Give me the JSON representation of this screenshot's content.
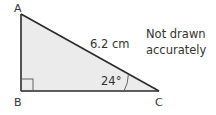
{
  "diagram": {
    "type": "right-triangle",
    "vertices": {
      "A": {
        "label": "A",
        "x": 21,
        "y": 14
      },
      "B": {
        "label": "B",
        "x": 21,
        "y": 91
      },
      "C": {
        "label": "C",
        "x": 159,
        "y": 91
      }
    },
    "hypotenuse_label": "6.2 cm",
    "angle_label": "24°",
    "right_angle_at": "B",
    "note": {
      "line1": "Not drawn",
      "line2": "accurately"
    },
    "colors": {
      "fill": "#ebebeb",
      "stroke": "#2a2a2a",
      "text": "#333333"
    }
  }
}
